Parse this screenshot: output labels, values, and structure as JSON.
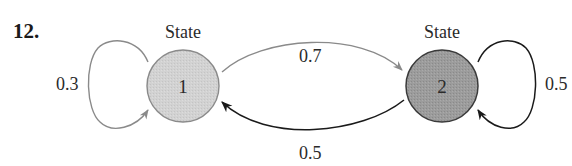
{
  "problem": {
    "number": "12."
  },
  "diagram": {
    "type": "markov-chain-state-diagram",
    "states": [
      {
        "id": "1",
        "caption": "State",
        "label": "1",
        "fill": "#d2d2d2",
        "stroke": "#8a8a8a"
      },
      {
        "id": "2",
        "caption": "State",
        "label": "2",
        "fill": "#9c9c9c",
        "stroke": "#3a3a3a"
      }
    ],
    "transitions": [
      {
        "from": "1",
        "to": "1",
        "probability": "0.3",
        "color": "#8a8a8a"
      },
      {
        "from": "1",
        "to": "2",
        "probability": "0.7",
        "color": "#8a8a8a"
      },
      {
        "from": "2",
        "to": "1",
        "probability": "0.5",
        "color": "#1a1a1a"
      },
      {
        "from": "2",
        "to": "2",
        "probability": "0.5",
        "color": "#1a1a1a"
      }
    ]
  }
}
